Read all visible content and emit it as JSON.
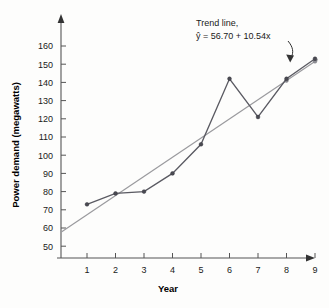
{
  "chart_data": {
    "type": "line",
    "title": "",
    "xlabel": "Year",
    "ylabel": "Power demand (megawatts)",
    "x": [
      1,
      2,
      3,
      4,
      5,
      6,
      7,
      8,
      9
    ],
    "xlim": [
      0,
      9.6
    ],
    "ylim": [
      44,
      166
    ],
    "xticks": [
      "1",
      "2",
      "3",
      "4",
      "5",
      "6",
      "7",
      "8",
      "9"
    ],
    "yticks": [
      "50",
      "60",
      "70",
      "80",
      "90",
      "100",
      "110",
      "120",
      "130",
      "140",
      "150",
      "160"
    ],
    "grid": false,
    "legend_position": "none",
    "series": [
      {
        "name": "Power demand",
        "kind": "data",
        "color": "#5a5a62",
        "values": [
          73,
          79,
          80,
          90,
          106,
          142,
          121,
          142,
          153
        ]
      },
      {
        "name": "Trend line",
        "kind": "trend",
        "color": "#9a9a9e",
        "equation": "y = 56.70 + 10.54x",
        "intercept": 56.7,
        "slope": 10.54,
        "x_start": 0.1,
        "x_end": 9.1
      }
    ],
    "annotations": [
      {
        "name": "trend-line-annotation",
        "line1": "Trend line,",
        "line2_prefix": "ŷ = 56.70 + 10.54",
        "line2_var": "x",
        "arrow": "curved arrow pointing down-right to trend line"
      }
    ]
  },
  "axes": {
    "y_axis_arrow": "arrow-up-icon",
    "x_axis_arrow": "arrow-right-icon"
  }
}
